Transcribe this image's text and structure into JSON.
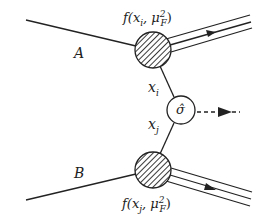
{
  "diagram": {
    "labels": {
      "hadron_a": "A",
      "hadron_b": "B",
      "pdf_top": "f(x",
      "pdf_top_sub": "i",
      "pdf_top_rest": ", μ",
      "pdf_top_sup": "2",
      "pdf_top_sub2": "F",
      "pdf_bottom": "f(x",
      "pdf_bottom_sub": "j",
      "pdf_bottom_rest": ", μ",
      "pdf_bottom_sup": "2",
      "pdf_bottom_sub2": "F",
      "xi": "x",
      "xi_sub": "i",
      "xj": "x",
      "xj_sub": "j",
      "sigma": "σ̂"
    },
    "nodes": [
      {
        "id": "pdf-a",
        "type": "hatched-blob",
        "cx": 153,
        "cy": 50,
        "r": 18
      },
      {
        "id": "pdf-b",
        "type": "hatched-blob",
        "cx": 153,
        "cy": 170,
        "r": 18
      },
      {
        "id": "hard-process",
        "type": "circle",
        "cx": 181,
        "cy": 110,
        "r": 14
      }
    ],
    "edges": [
      {
        "from": "hadron-A",
        "to": "pdf-a",
        "style": "solid"
      },
      {
        "from": "hadron-B",
        "to": "pdf-b",
        "style": "solid"
      },
      {
        "from": "pdf-a",
        "to": "hard-process",
        "label": "x_i"
      },
      {
        "from": "pdf-b",
        "to": "hard-process",
        "label": "x_j"
      },
      {
        "from": "pdf-a",
        "to": "remnant-A",
        "style": "triple-line-arrow"
      },
      {
        "from": "pdf-b",
        "to": "remnant-B",
        "style": "triple-line-arrow"
      },
      {
        "from": "hard-process",
        "to": "final-state",
        "style": "dashed-arrow"
      }
    ]
  }
}
